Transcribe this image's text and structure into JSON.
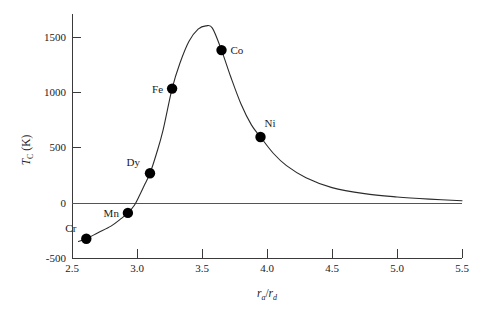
{
  "chart_data": {
    "type": "line",
    "title": "",
    "subtitle": "",
    "xlabel": "r_a/r_d",
    "ylabel": "T_C (K)",
    "xlim": [
      2.5,
      5.5
    ],
    "ylim": [
      -500,
      1750
    ],
    "grid": false,
    "legend": "none",
    "x_ticks": [
      "2.5",
      "3.0",
      "3.5",
      "4.0",
      "4.5",
      "5.0",
      "5.5"
    ],
    "x_tick_values": [
      2.5,
      3.0,
      3.5,
      4.0,
      4.5,
      5.0,
      5.5
    ],
    "y_ticks": [
      "-500",
      "0",
      "500",
      "1000",
      "1500"
    ],
    "y_tick_values": [
      -500,
      0,
      500,
      1000,
      1500
    ],
    "zero_reference_line": 0,
    "series": [
      {
        "name": "Bethe-Slater curve",
        "x": [
          2.55,
          2.61,
          2.7,
          2.8,
          2.88,
          2.93,
          2.98,
          3.02,
          3.06,
          3.1,
          3.15,
          3.2,
          3.27,
          3.33,
          3.4,
          3.47,
          3.53,
          3.58,
          3.65,
          3.72,
          3.8,
          3.88,
          3.95,
          4.05,
          4.15,
          4.3,
          4.5,
          4.75,
          5.0,
          5.25,
          5.5
        ],
        "y": [
          -350,
          -325,
          -270,
          -210,
          -140,
          -90,
          -20,
          70,
          170,
          270,
          450,
          660,
          1040,
          1270,
          1470,
          1580,
          1610,
          1590,
          1390,
          1150,
          900,
          710,
          600,
          450,
          340,
          230,
          140,
          85,
          55,
          35,
          20
        ]
      }
    ],
    "points": [
      {
        "label": "Cr",
        "x": 2.61,
        "y": -325,
        "label_position": "above-left"
      },
      {
        "label": "Mn",
        "x": 2.93,
        "y": -90,
        "label_position": "left"
      },
      {
        "label": "Dy",
        "x": 3.1,
        "y": 270,
        "label_position": "above-left"
      },
      {
        "label": "Fe",
        "x": 3.27,
        "y": 1040,
        "label_position": "left"
      },
      {
        "label": "Co",
        "x": 3.65,
        "y": 1390,
        "label_position": "right"
      },
      {
        "label": "Ni",
        "x": 3.95,
        "y": 600,
        "label_position": "above-right"
      }
    ],
    "marker_color": "#000000",
    "curve_color": "#2b2b2b",
    "axis_color": "#3a3a3a",
    "background_color": "#ffffff"
  },
  "axes": {
    "y_axis_label_main": "T",
    "y_axis_label_sub": "C",
    "y_axis_label_unit": " (K)",
    "x_axis_label_num": "r",
    "x_axis_label_num_sub": "a",
    "x_axis_label_slash": "/",
    "x_axis_label_den": "r",
    "x_axis_label_den_sub": "d"
  },
  "ticks": {
    "y": {
      "t1500": "1500",
      "t1000": "1000",
      "t500": "500",
      "t0": "0",
      "tm500": "-500"
    },
    "x": {
      "t25": "2.5",
      "t30": "3.0",
      "t35": "3.5",
      "t40": "4.0",
      "t45": "4.5",
      "t50": "5.0",
      "t55": "5.5"
    }
  },
  "labels": {
    "cr": "Cr",
    "mn": "Mn",
    "dy": "Dy",
    "fe": "Fe",
    "co": "Co",
    "ni": "Ni"
  }
}
